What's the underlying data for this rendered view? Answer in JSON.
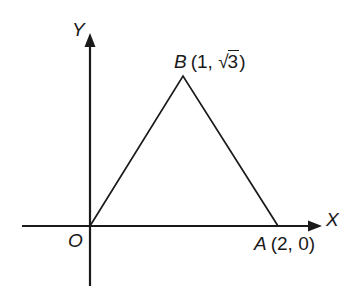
{
  "figure": {
    "type": "coordinate-geometry-diagram",
    "background_color": "#ffffff",
    "stroke_color": "#1a1a1a",
    "axes": {
      "x_axis_label": "X",
      "y_axis_label": "Y",
      "origin_label": "O",
      "x_axis": {
        "start_px": 22,
        "end_px": 322,
        "y_px": 226,
        "arrow": "right"
      },
      "y_axis": {
        "top_px": 33,
        "bottom_px": 286,
        "x_px": 90,
        "arrow": "up"
      }
    },
    "points": [
      {
        "name": "O",
        "coords_text": "",
        "x_px": 90,
        "y_px": 226,
        "label_position": "below-left"
      },
      {
        "name": "B",
        "coords_text": "(1, √3)",
        "coords_prefix": "(1, ",
        "radical_symbol": "√",
        "radicand": "3",
        "coords_suffix": ")",
        "x_px": 183,
        "y_px": 76,
        "label_position": "above"
      },
      {
        "name": "A",
        "coords_text": "(2, 0)",
        "x_px": 278,
        "y_px": 226,
        "label_position": "below"
      }
    ],
    "triangle": {
      "vertices_px": [
        [
          90,
          226
        ],
        [
          183,
          76
        ],
        [
          278,
          226
        ]
      ],
      "filled": false,
      "stroke_width": 1.6
    }
  }
}
